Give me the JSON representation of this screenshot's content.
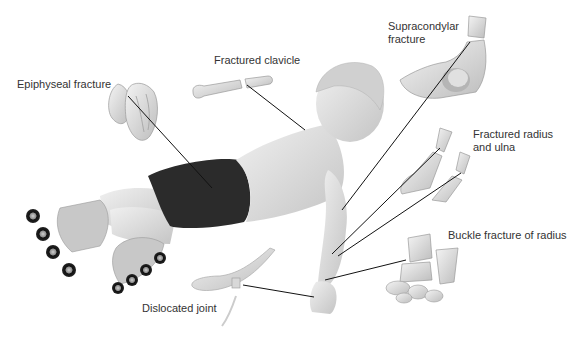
{
  "diagram": {
    "type": "medical-illustration",
    "labels": [
      {
        "id": "epiphyseal",
        "text": "Epiphyseal fracture",
        "x": 17,
        "y": 78
      },
      {
        "id": "clavicle",
        "text": "Fractured clavicle",
        "x": 214,
        "y": 54
      },
      {
        "id": "supracondylar",
        "text": "Supracondylar\nfracture",
        "x": 388,
        "y": 20
      },
      {
        "id": "radius-ulna",
        "text": "Fractured radius\nand ulna",
        "x": 473,
        "y": 128
      },
      {
        "id": "buckle",
        "text": "Buckle fracture of radius",
        "x": 448,
        "y": 229
      },
      {
        "id": "dislocated",
        "text": "Dislocated joint",
        "x": 142,
        "y": 302
      }
    ],
    "leader_lines": [
      {
        "id": "epiphyseal",
        "x1": 128,
        "y1": 96,
        "x2": 212,
        "y2": 188
      },
      {
        "id": "clavicle",
        "x1": 247,
        "y1": 85,
        "x2": 305,
        "y2": 130
      },
      {
        "id": "supracondylar",
        "x1": 470,
        "y1": 42,
        "x2": 342,
        "y2": 210
      },
      {
        "id": "radius-ulna-1",
        "x1": 440,
        "y1": 148,
        "x2": 332,
        "y2": 254
      },
      {
        "id": "radius-ulna-2",
        "x1": 461,
        "y1": 173,
        "x2": 338,
        "y2": 256
      },
      {
        "id": "buckle",
        "x1": 406,
        "y1": 260,
        "x2": 325,
        "y2": 280
      },
      {
        "id": "dislocated",
        "x1": 243,
        "y1": 285,
        "x2": 314,
        "y2": 297
      }
    ],
    "colors": {
      "background": "#ffffff",
      "skin": "#e6e6e6",
      "skin_shadow": "#bdbdbd",
      "shorts": "#2b2b2b",
      "bone": "#e3e3e3",
      "bone_outline": "#9a9a9a",
      "leader_line": "#111111",
      "label_text": "#333333",
      "wheel": "#1a1a1a"
    }
  }
}
